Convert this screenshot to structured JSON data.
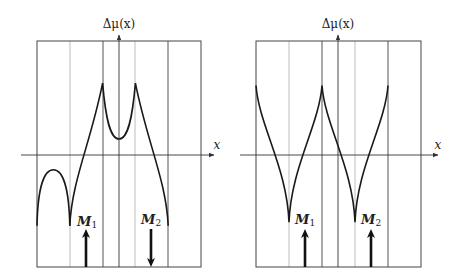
{
  "panels": [
    {
      "id": "left",
      "y_axis_label": "Δμ(x)",
      "x_axis_label": "x",
      "regions": 5,
      "magnets": [
        {
          "label": "M",
          "subscript": "1",
          "direction": "up"
        },
        {
          "label": "M",
          "subscript": "2",
          "direction": "down"
        }
      ],
      "curve_description": "arch in first region, rising branch to cusp peak, dip at center, cusp peak, falling branch",
      "curve_points_normalized": [
        {
          "segment": "arch",
          "points": [
            [
              0.0,
              -0.62
            ],
            [
              0.1,
              -0.13
            ],
            [
              0.2,
              -0.62
            ]
          ]
        },
        {
          "segment": "main",
          "points": [
            [
              0.2,
              -0.62
            ],
            [
              0.4,
              0.63
            ],
            [
              0.5,
              0.14
            ],
            [
              0.6,
              0.63
            ],
            [
              0.8,
              -0.62
            ]
          ]
        }
      ]
    },
    {
      "id": "right",
      "y_axis_label": "Δμ(x)",
      "x_axis_label": "x",
      "regions": 5,
      "magnets": [
        {
          "label": "M",
          "subscript": "1",
          "direction": "up"
        },
        {
          "label": "M",
          "subscript": "2",
          "direction": "up"
        }
      ],
      "curve_description": "periodic cusps: peaks at region boundaries, sharp minima at magnet positions",
      "curve_points_normalized": [
        {
          "segment": "main",
          "points": [
            [
              0.0,
              0.61
            ],
            [
              0.2,
              -0.59
            ],
            [
              0.4,
              0.61
            ],
            [
              0.6,
              -0.59
            ],
            [
              0.8,
              0.61
            ]
          ]
        }
      ]
    }
  ]
}
